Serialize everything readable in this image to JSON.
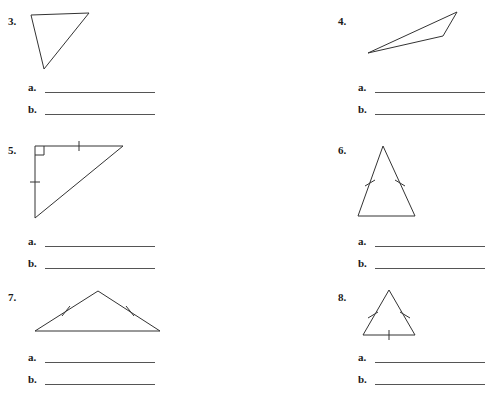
{
  "worksheet": {
    "background_color": "#ffffff",
    "ink_color": "#333333",
    "line_color": "#555555",
    "text_color": "#1a1a1a"
  },
  "answer_labels": {
    "a": "a.",
    "b": "b."
  },
  "problems": [
    {
      "number": "3.",
      "num_x": 8,
      "num_y": 16,
      "figure": {
        "name": "scalene-triangle-inverted",
        "x": 25,
        "y": 8,
        "width": 80,
        "height": 68,
        "points": "6,7 64,5 19,61",
        "ticks": [],
        "right_angle": null
      },
      "answers": {
        "x": 28,
        "y": 82,
        "line_width": 110
      }
    },
    {
      "number": "4.",
      "num_x": 338,
      "num_y": 16,
      "figure": {
        "name": "thin-obtuse-triangle",
        "x": 360,
        "y": 6,
        "width": 105,
        "height": 58,
        "points": "8,47 97,6 83,30",
        "ticks": [],
        "right_angle": null
      },
      "answers": {
        "x": 358,
        "y": 82,
        "line_width": 110
      }
    },
    {
      "number": "5.",
      "num_x": 8,
      "num_y": 145,
      "figure": {
        "name": "isosceles-right-triangle",
        "x": 30,
        "y": 140,
        "width": 100,
        "height": 90,
        "points": "5,6 93,6 5,78",
        "ticks": [
          {
            "x1": 49,
            "y1": 1,
            "x2": 49,
            "y2": 11
          },
          {
            "x1": 0,
            "y1": 42,
            "x2": 10,
            "y2": 42
          }
        ],
        "right_angle": {
          "x": 5,
          "y": 6,
          "size": 9,
          "dir_x": 1,
          "dir_y": 1
        }
      },
      "answers": {
        "x": 28,
        "y": 236,
        "line_width": 110
      }
    },
    {
      "number": "6.",
      "num_x": 338,
      "num_y": 145,
      "figure": {
        "name": "tall-isosceles-triangle",
        "x": 352,
        "y": 142,
        "width": 72,
        "height": 80,
        "points": "31,4 63,74 6,74",
        "ticks": [
          {
            "x1": 13,
            "y1": 44,
            "x2": 23,
            "y2": 38
          },
          {
            "x1": 43,
            "y1": 38,
            "x2": 53,
            "y2": 44
          }
        ],
        "right_angle": null
      },
      "answers": {
        "x": 358,
        "y": 236,
        "line_width": 110
      }
    },
    {
      "number": "7.",
      "num_x": 8,
      "num_y": 292,
      "figure": {
        "name": "wide-isosceles-triangle",
        "x": 30,
        "y": 286,
        "width": 140,
        "height": 52,
        "points": "68,5 130,45 5,45",
        "ticks": [
          {
            "x1": 32,
            "y1": 30,
            "x2": 40,
            "y2": 20
          },
          {
            "x1": 96,
            "y1": 20,
            "x2": 104,
            "y2": 30
          }
        ],
        "right_angle": null
      },
      "answers": {
        "x": 28,
        "y": 352,
        "line_width": 110
      }
    },
    {
      "number": "8.",
      "num_x": 338,
      "num_y": 292,
      "figure": {
        "name": "equilateral-triangle",
        "x": 355,
        "y": 286,
        "width": 70,
        "height": 56,
        "points": "34,4 60,49 8,49",
        "ticks": [
          {
            "x1": 13,
            "y1": 32,
            "x2": 23,
            "y2": 26
          },
          {
            "x1": 45,
            "y1": 26,
            "x2": 55,
            "y2": 32
          },
          {
            "x1": 34,
            "y1": 44,
            "x2": 34,
            "y2": 54
          }
        ],
        "right_angle": null
      },
      "answers": {
        "x": 358,
        "y": 352,
        "line_width": 110
      }
    }
  ]
}
